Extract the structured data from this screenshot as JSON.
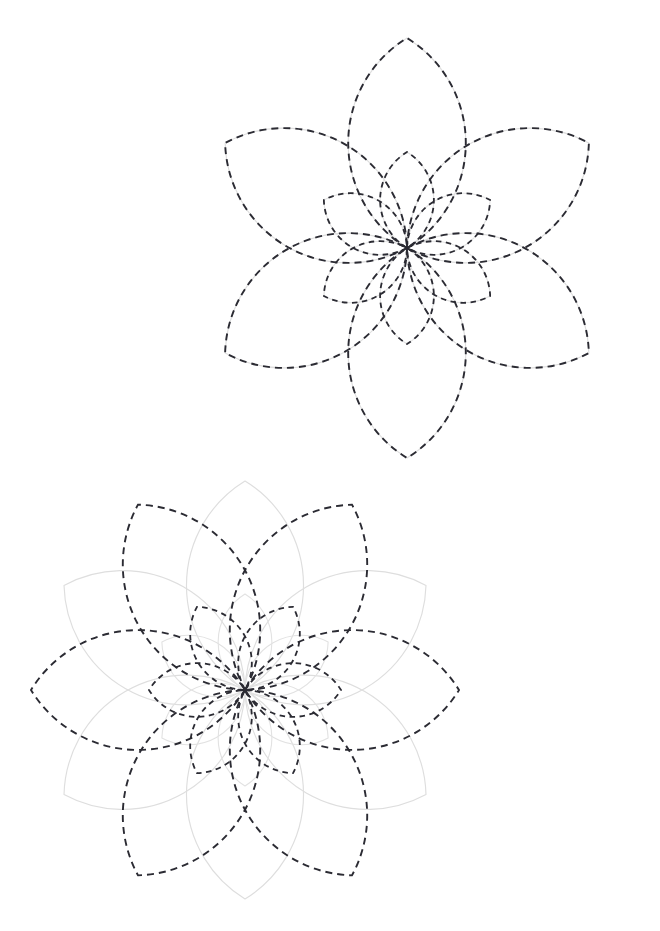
{
  "page": {
    "background_color": "#ffffff",
    "width": 660,
    "height": 931,
    "figure_count": 2
  },
  "palette": {
    "grey_stroke": "#dedede",
    "dark_stroke": "#2b2b33",
    "background": "#ffffff"
  },
  "chart_data": {
    "type": "scatter",
    "xlabel": "",
    "ylabel": "",
    "figures": [
      {
        "name": "figure-top",
        "center": [
          407,
          248
        ],
        "layers": [
          {
            "layer_name": "grey-outer-rosette",
            "style": "solid",
            "color": "#dedede",
            "petal_count": 6,
            "petal_length": 210,
            "rotation_deg": 0,
            "arc_bulge": 0.56
          },
          {
            "layer_name": "grey-inner-rosette",
            "style": "solid",
            "color": "#dedede",
            "petal_count": 6,
            "petal_length": 96,
            "rotation_deg": 0,
            "arc_bulge": 0.56
          },
          {
            "layer_name": "dark-outer-rosette",
            "style": "dashed",
            "color": "#2b2b33",
            "petal_count": 6,
            "petal_length": 210,
            "rotation_deg": 0,
            "arc_bulge": 0.56
          },
          {
            "layer_name": "dark-inner-rosette",
            "style": "dashed",
            "color": "#2b2b33",
            "petal_count": 6,
            "petal_length": 96,
            "rotation_deg": 0,
            "arc_bulge": 0.56
          }
        ],
        "extremes": {
          "top_dark_tip": [
            410,
            38
          ],
          "bottom_grey_tip": [
            407,
            458
          ],
          "left_grey_tip": [
            193,
            250
          ],
          "dark_bottom_left_corner": [
            255,
            395
          ],
          "dark_bottom_right_corner": [
            558,
            397
          ],
          "grey_upper_left_corner": [
            258,
            102
          ]
        }
      },
      {
        "name": "figure-bottom",
        "center": [
          245,
          690
        ],
        "layers": [
          {
            "layer_name": "grey-outer-rosette",
            "style": "solid",
            "color": "#dedede",
            "petal_count": 6,
            "petal_length": 209,
            "rotation_deg": 0,
            "arc_bulge": 0.56
          },
          {
            "layer_name": "grey-inner-rosette",
            "style": "solid",
            "color": "#dedede",
            "petal_count": 6,
            "petal_length": 96,
            "rotation_deg": 0,
            "arc_bulge": 0.56
          },
          {
            "layer_name": "dark-outer-rosette",
            "style": "dashed",
            "color": "#2b2b33",
            "petal_count": 6,
            "petal_length": 214,
            "rotation_deg": 30,
            "arc_bulge": 0.56
          },
          {
            "layer_name": "dark-inner-rosette",
            "style": "dashed",
            "color": "#2b2b33",
            "petal_count": 6,
            "petal_length": 96,
            "rotation_deg": 30,
            "arc_bulge": 0.56
          }
        ],
        "extremes": {
          "top_grey_tip": [
            247,
            482
          ],
          "bottom_grey_tip": [
            245,
            900
          ],
          "left_dark_tip": [
            33,
            690
          ],
          "right_dark_tip": [
            462,
            690
          ]
        }
      }
    ]
  }
}
